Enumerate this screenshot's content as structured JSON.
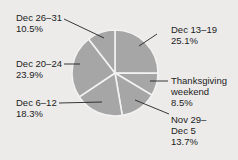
{
  "chart_data": {
    "type": "pie",
    "title": "",
    "start_angle": "12 o'clock",
    "direction": "clockwise",
    "slice_color": "#a6a6a6",
    "separator_color": "#f2f2f2",
    "categories": [
      "Dec 13–19",
      "Thanksgiving weekend",
      "Nov 29–Dec 5",
      "Dec 6–12",
      "Dec 20–24",
      "Dec 26–31"
    ],
    "values": [
      25.1,
      8.5,
      13.7,
      18.3,
      23.9,
      10.5
    ],
    "unit": "%",
    "labels": [
      {
        "name": "Dec 13–19",
        "value": "25.1%"
      },
      {
        "name": "Thanksgiving weekend",
        "value": "8.5%"
      },
      {
        "name": "Nov 29–Dec 5",
        "value": "13.7%"
      },
      {
        "name": "Dec 6–12",
        "value": "18.3%"
      },
      {
        "name": "Dec 20–24",
        "value": "23.9%"
      },
      {
        "name": "Dec 26–31",
        "value": "10.5%"
      }
    ]
  },
  "text": {
    "dec13_line1": "Dec 13–19",
    "dec13_line2": "25.1%",
    "thanks_line1": "Thanksgiving",
    "thanks_line2": "weekend",
    "thanks_line3": "8.5%",
    "nov29_line1": "Nov 29–",
    "nov29_line2": "Dec 5",
    "nov29_line3": "13.7%",
    "dec6_line1": "Dec 6–12",
    "dec6_line2": "18.3%",
    "dec20_line1": "Dec 20–24",
    "dec20_line2": "23.9%",
    "dec26_line1": "Dec 26–31",
    "dec26_line2": "10.5%"
  }
}
